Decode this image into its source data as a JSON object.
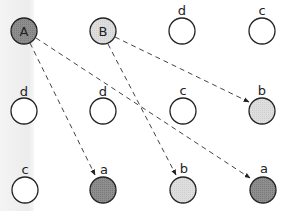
{
  "diagram": {
    "colors": {
      "dark_fill": "#8c8c8c",
      "light_fill": "#dcdcdc",
      "empty_fill": "#ffffff",
      "stroke": "#222222",
      "edge": "#444444"
    },
    "nodes": [
      {
        "id": "A",
        "label": "A",
        "label_position": "inside",
        "fill": "dark",
        "row": 1,
        "col": 1
      },
      {
        "id": "B",
        "label": "B",
        "label_position": "inside",
        "fill": "light",
        "row": 1,
        "col": 2
      },
      {
        "id": "d1",
        "label": "d",
        "label_position": "above",
        "fill": "empty",
        "row": 1,
        "col": 3
      },
      {
        "id": "c1",
        "label": "c",
        "label_position": "above",
        "fill": "empty",
        "row": 1,
        "col": 4
      },
      {
        "id": "d2",
        "label": "d",
        "label_position": "above",
        "fill": "empty",
        "row": 2,
        "col": 1
      },
      {
        "id": "d3",
        "label": "d",
        "label_position": "above",
        "fill": "empty",
        "row": 2,
        "col": 2
      },
      {
        "id": "c2",
        "label": "c",
        "label_position": "above",
        "fill": "empty",
        "row": 2,
        "col": 3
      },
      {
        "id": "b1",
        "label": "b",
        "label_position": "above",
        "fill": "light",
        "row": 2,
        "col": 4
      },
      {
        "id": "c3",
        "label": "c",
        "label_position": "above",
        "fill": "empty",
        "row": 3,
        "col": 1
      },
      {
        "id": "a1",
        "label": "a",
        "label_position": "above",
        "fill": "dark",
        "row": 3,
        "col": 2
      },
      {
        "id": "b2",
        "label": "b",
        "label_position": "above",
        "fill": "light",
        "row": 3,
        "col": 3
      },
      {
        "id": "a2",
        "label": "a",
        "label_position": "above",
        "fill": "dark",
        "row": 3,
        "col": 4
      }
    ],
    "edges": [
      {
        "from": "A",
        "to": "a1",
        "style": "dashed",
        "arrow": true
      },
      {
        "from": "A",
        "to": "a2",
        "style": "dashed",
        "arrow": true
      },
      {
        "from": "B",
        "to": "b1",
        "style": "dashed",
        "arrow": true
      },
      {
        "from": "B",
        "to": "b2",
        "style": "dashed",
        "arrow": true
      }
    ]
  }
}
